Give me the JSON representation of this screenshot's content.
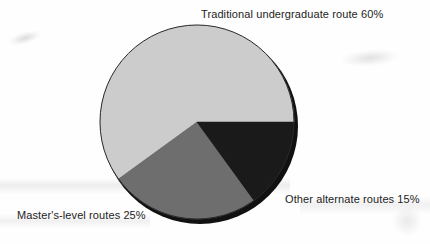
{
  "chart_data": {
    "type": "pie",
    "title": "",
    "subtitle": "",
    "xlabel": "",
    "ylabel": "",
    "legend_position": "none",
    "grid": false,
    "labels": [
      "Traditional undergraduate route",
      "Master's-level routes",
      "Other alternate routes"
    ],
    "values": [
      60,
      25,
      15
    ],
    "unit": "%",
    "colors": [
      "#cccccc",
      "#6e6e6e",
      "#1a1a1a"
    ],
    "annotations": [
      "Traditional undergraduate route 60%",
      "Master's-level routes 25%",
      "Other alternate routes 15%"
    ],
    "slices": [
      {
        "name": "traditional-undergraduate-route",
        "label": "Traditional undergraduate route",
        "value": 60,
        "value_text": "60%",
        "annotation": "Traditional undergraduate route 60%",
        "color": "#cccccc",
        "start_angle_deg": 0,
        "end_angle_deg": 216
      },
      {
        "name": "masters-level-routes",
        "label": "Master's-level routes",
        "value": 25,
        "value_text": "25%",
        "annotation": "Master's-level routes 25%",
        "color": "#6e6e6e",
        "start_angle_deg": 216,
        "end_angle_deg": 306
      },
      {
        "name": "other-alternate-routes",
        "label": "Other alternate routes",
        "value": 15,
        "value_text": "15%",
        "annotation": "Other alternate routes 15%",
        "color": "#1a1a1a",
        "start_angle_deg": 306,
        "end_angle_deg": 360
      }
    ],
    "geometry": {
      "center_x": 197,
      "center_y": 122,
      "radius": 97,
      "shadow_color": "#111111",
      "background": "#fefefe"
    }
  }
}
